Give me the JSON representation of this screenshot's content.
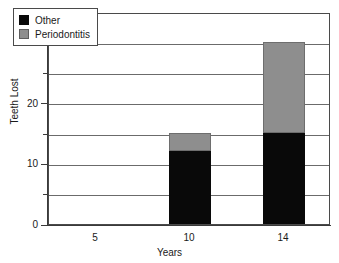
{
  "chart_data": {
    "type": "bar",
    "subtype": "stacked-bar",
    "title": "",
    "xlabel": "Years",
    "ylabel": "Teeth Lost",
    "categories": [
      "5",
      "10",
      "14"
    ],
    "series": [
      {
        "name": "Other",
        "color": "#090909",
        "values": [
          0,
          12,
          15
        ]
      },
      {
        "name": "Periodontitis",
        "color": "#8e8e8e",
        "values": [
          0,
          3,
          15
        ]
      }
    ],
    "totals": [
      0,
      15,
      30
    ],
    "ylim": [
      0,
      35
    ],
    "xlim_note": "categorical axis with 3 tick positions",
    "yticks_major": [
      0,
      10,
      20,
      30
    ],
    "yticks_minor": [
      5,
      15,
      25,
      35
    ],
    "ytick_labels": [
      "0",
      "10",
      "20",
      "30"
    ],
    "xtick_labels": [
      "5",
      "10",
      "14"
    ],
    "gridlines": "horizontal gridlines every 5 units",
    "grid": true,
    "legend_position": "upper-left inside plot area",
    "legend_entries": [
      "Other",
      "Periodontitis"
    ],
    "frame": "full rectangular border"
  },
  "axes": {
    "y_title": "Teeth Lost",
    "x_title": "Years",
    "y_labels": [
      {
        "value": 30,
        "text": "30"
      },
      {
        "value": 20,
        "text": "20"
      },
      {
        "value": 10,
        "text": "10"
      },
      {
        "value": 0,
        "text": "0"
      }
    ],
    "x_labels": [
      {
        "index": 0,
        "text": "5"
      },
      {
        "index": 1,
        "text": "10"
      },
      {
        "index": 2,
        "text": "14"
      }
    ]
  },
  "legend": {
    "items": [
      {
        "label": "Other",
        "swatch": "black-square-swatch"
      },
      {
        "label": "Periodontitis",
        "swatch": "gray-square-swatch"
      }
    ]
  },
  "colors": {
    "other": "#090909",
    "periodontitis": "#8e8e8e",
    "axis": "#3a3a3a",
    "grid": "#6b6b6b",
    "background": "#ffffff",
    "text": "#1a1a1a"
  }
}
